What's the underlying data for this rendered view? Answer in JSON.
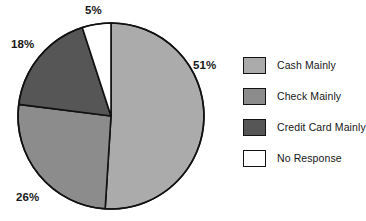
{
  "chart_data": {
    "type": "pie",
    "title": "",
    "subtitle": "",
    "xlabel": "",
    "ylabel": "",
    "grid": false,
    "legend_position": "right",
    "start_angle_deg": 0,
    "direction": "clockwise",
    "center": {
      "x": 111,
      "y": 116
    },
    "radius": 93,
    "categories": [
      "Cash Mainly",
      "Check Mainly",
      "Credit Card Mainly",
      "No Response"
    ],
    "values": [
      51,
      26,
      18,
      5
    ],
    "value_unit": "%",
    "data_labels": [
      "51%",
      "26%",
      "18%",
      "5%"
    ],
    "colors": [
      "#ababab",
      "#8c8c8c",
      "#565656",
      "#ffffff"
    ],
    "slice_outline_color": "#111111",
    "slices": [
      {
        "label": "Cash Mainly",
        "value": 51,
        "data_label": "51%",
        "color": "#ababab"
      },
      {
        "label": "Check Mainly",
        "value": 26,
        "data_label": "26%",
        "color": "#8c8c8c"
      },
      {
        "label": "Credit Card Mainly",
        "value": 18,
        "data_label": "18%",
        "color": "#565656"
      },
      {
        "label": "No Response",
        "value": 5,
        "data_label": "5%",
        "color": "#ffffff"
      }
    ]
  },
  "labels": {
    "cash": "51%",
    "check": "26%",
    "credit": "18%",
    "none": "5%"
  },
  "legend": {
    "items": [
      {
        "label": "Cash Mainly",
        "color": "#ababab"
      },
      {
        "label": "Check Mainly",
        "color": "#8c8c8c"
      },
      {
        "label": "Credit Card Mainly",
        "color": "#565656"
      },
      {
        "label": "No Response",
        "color": "#ffffff"
      }
    ]
  }
}
